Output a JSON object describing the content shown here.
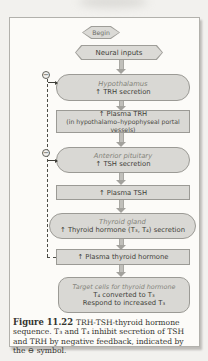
{
  "figure": {
    "nodes": {
      "begin": {
        "label": "Begin"
      },
      "neural": {
        "label": "Neural inputs"
      },
      "hypothalamus": {
        "title": "Hypothalamus",
        "line1": "↑ TRH secretion"
      },
      "plasma_trh": {
        "line1": "↑ Plasma TRH",
        "line2": "(in hypothalamo–hypophyseal portal vessels)"
      },
      "anterior_pituitary": {
        "title": "Anterior pituitary",
        "line1": "↑ TSH secretion"
      },
      "plasma_tsh": {
        "line1": "↑ Plasma TSH"
      },
      "thyroid_gland": {
        "title": "Thyroid gland",
        "line1": "↑ Thyroid hormone (T₃, T₄) secretion"
      },
      "plasma_thyroid_hormone": {
        "line1": "↑ Plasma thyroid hormone"
      },
      "target_cells": {
        "title": "Target cells for thyroid hormone",
        "line1": "T₄ converted to T₃",
        "line2": "Respond to increased T₃"
      }
    },
    "feedback": {
      "symbol": "−"
    }
  },
  "caption": {
    "figure_label": "Figure 11.22",
    "text": "TRH-TSH-thyroid hormone sequence. T₃ and T₄ inhibit secretion of TSH and TRH by negative feedback, indicated by the ⊖ symbol."
  },
  "colors": {
    "page_background": "#f2f1ee",
    "card_background": "#fcfbf8",
    "box_fill": "#d9d8d4",
    "box_border": "#9b9a95",
    "arrow_gray": "#b5b4b0",
    "text": "#3f3f39",
    "organ_label_italic": "#84847b"
  }
}
